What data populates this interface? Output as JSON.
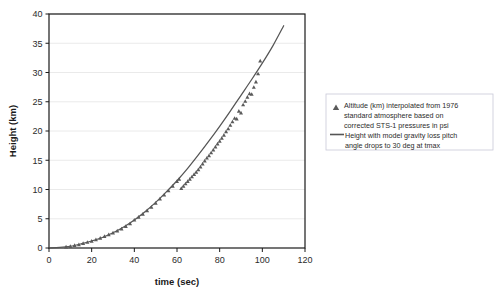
{
  "chart_data": {
    "type": "scatter",
    "title": "",
    "subtitle": "",
    "xlabel": "time (sec)",
    "ylabel": "Height (km)",
    "xlim": [
      0,
      120
    ],
    "ylim": [
      0,
      40
    ],
    "xticks": [
      0,
      20,
      40,
      60,
      80,
      100,
      120
    ],
    "yticks": [
      0,
      5,
      10,
      15,
      20,
      25,
      30,
      35,
      40
    ],
    "grid": {
      "horizontal": true,
      "vertical": false,
      "color": "#e8e8e8"
    },
    "legend": {
      "position": "right-outside",
      "border": true,
      "entries": [
        {
          "marker": "triangle",
          "color": "#5a5a5a",
          "label": "Altitude (km) interpolated from 1976 standard atmosphere based on corrected STS-1 pressures in psi",
          "lines": [
            "Altitude (km) interpolated from 1976",
            "standard atmosphere based on",
            "corrected STS-1 pressures in psi"
          ]
        },
        {
          "marker": "line",
          "color": "#555555",
          "label": "Height with model gravity loss pitch angle drops to 30 deg at tmax",
          "lines": [
            "Height with model gravity loss pitch",
            "angle drops to 30 deg at tmax"
          ]
        }
      ]
    },
    "series": [
      {
        "name": "Height with model gravity loss pitch angle drops to 30 deg at tmax",
        "type": "line",
        "color": "#555555",
        "x": [
          0,
          5,
          10,
          15,
          20,
          25,
          30,
          35,
          40,
          45,
          50,
          55,
          60,
          65,
          70,
          75,
          80,
          85,
          90,
          95,
          100,
          105,
          110
        ],
        "y": [
          0.0,
          0.1,
          0.3,
          0.7,
          1.2,
          1.8,
          2.6,
          3.6,
          4.8,
          6.2,
          7.8,
          9.6,
          11.5,
          13.6,
          15.9,
          18.3,
          20.8,
          23.4,
          26.1,
          28.8,
          31.6,
          34.6,
          38.0
        ]
      },
      {
        "name": "Altitude (km) interpolated from 1976 standard atmosphere based on corrected STS-1 pressures in psi",
        "type": "scatter",
        "marker": "triangle",
        "color": "#5a5a5a",
        "x": [
          8,
          10,
          12,
          14,
          16,
          18,
          20,
          22,
          24,
          26,
          28,
          30,
          32,
          34,
          36,
          38,
          40,
          42,
          44,
          46,
          48,
          50,
          52,
          54,
          56,
          58,
          60,
          61,
          62,
          63,
          64,
          65,
          66,
          67,
          68,
          69,
          70,
          71,
          72,
          73,
          74,
          75,
          76,
          77,
          78,
          79,
          80,
          81,
          82,
          83,
          84,
          85,
          86,
          87,
          88,
          89,
          90,
          91,
          92,
          93,
          94,
          95,
          96,
          97,
          98,
          99
        ],
        "y": [
          0.2,
          0.3,
          0.45,
          0.6,
          0.8,
          1.0,
          1.2,
          1.45,
          1.7,
          2.0,
          2.3,
          2.6,
          2.95,
          3.3,
          3.7,
          4.2,
          4.8,
          5.3,
          5.8,
          6.4,
          7.0,
          7.7,
          8.4,
          9.1,
          9.8,
          10.6,
          11.4,
          11.8,
          10.2,
          10.6,
          11.0,
          11.4,
          11.8,
          12.2,
          12.6,
          13.0,
          13.4,
          13.9,
          14.4,
          14.9,
          15.4,
          15.8,
          16.3,
          16.8,
          17.3,
          17.8,
          18.3,
          18.8,
          19.3,
          19.9,
          20.4,
          21.0,
          21.6,
          22.2,
          22.1,
          23.4,
          23.1,
          24.5,
          25.1,
          25.8,
          26.4,
          26.3,
          27.5,
          28.4,
          29.8,
          32.0
        ]
      }
    ]
  },
  "axes": {
    "x_title": "time (sec)",
    "y_title": "Height (km)",
    "x_tick_labels": [
      "0",
      "20",
      "40",
      "60",
      "80",
      "100",
      "120"
    ],
    "y_tick_labels": [
      "0",
      "5",
      "10",
      "15",
      "20",
      "25",
      "30",
      "35",
      "40"
    ]
  },
  "legend": {
    "entry1_line1": "Altitude (km) interpolated from 1976",
    "entry1_line2": "standard atmosphere based on",
    "entry1_line3": "corrected STS-1 pressures in psi",
    "entry2_line1": "Height with model gravity loss pitch",
    "entry2_line2": "angle drops to 30 deg at tmax"
  },
  "colors": {
    "line": "#555555",
    "marker": "#5a5a5a",
    "grid": "#e8e8e8",
    "axis": "#1a1a1a",
    "legend_border": "#c8c8d8",
    "background": "#ffffff"
  }
}
